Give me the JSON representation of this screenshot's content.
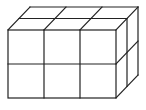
{
  "diagram": {
    "type": "cuboid-grid",
    "dimensions": {
      "width": 3,
      "height": 2,
      "depth": 2
    },
    "line_color": "#222222",
    "background": "#ffffff"
  }
}
